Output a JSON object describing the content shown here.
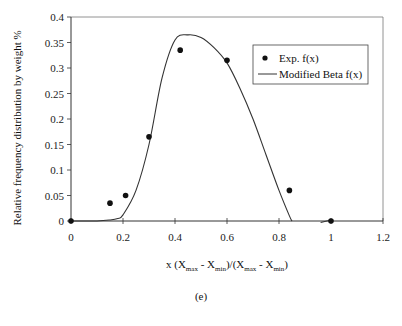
{
  "chart_data": {
    "type": "scatter",
    "title": "",
    "xlabel": "x (Xmax - Xmin)/(Xmax - Xmin)",
    "ylabel": "Relative frequency distribution by weight %",
    "xlim": [
      0,
      1.2
    ],
    "ylim": [
      0,
      0.4
    ],
    "x_ticks": [
      "0",
      "0.2",
      "0.4",
      "0.6",
      "0.8",
      "1",
      "1.2"
    ],
    "y_ticks": [
      "0",
      "0.05",
      "0.1",
      "0.15",
      "0.2",
      "0.25",
      "0.3",
      "0.35",
      "0.4"
    ],
    "grid": false,
    "legend_position": "upper right",
    "series": [
      {
        "name": "Exp. f(x)",
        "style": "markers",
        "x": [
          0,
          0.15,
          0.21,
          0.3,
          0.42,
          0.6,
          0.84,
          1.0
        ],
        "y": [
          0,
          0.035,
          0.05,
          0.165,
          0.335,
          0.315,
          0.06,
          0
        ]
      },
      {
        "name": "Modified Beta f(x)",
        "style": "line",
        "x": [
          0,
          0.1,
          0.15,
          0.18,
          0.2,
          0.25,
          0.3,
          0.35,
          0.4,
          0.45,
          0.5,
          0.55,
          0.6,
          0.65,
          0.7,
          0.75,
          0.8,
          0.84,
          0.85
        ],
        "y": [
          0,
          0.0,
          0.002,
          0.005,
          0.012,
          0.06,
          0.15,
          0.28,
          0.355,
          0.365,
          0.36,
          0.34,
          0.31,
          0.26,
          0.2,
          0.13,
          0.06,
          0.01,
          0
        ],
        "extra_segment": {
          "x": [
            0.96,
            1.0
          ],
          "y": [
            -0.003,
            0.002
          ]
        }
      }
    ]
  },
  "labels": {
    "ylabel": "Relative frequency distribution by weight %",
    "xlabel_prefix": "x (X",
    "xlabel_sub1": "max",
    "xlabel_mid1": " - X",
    "xlabel_sub2": "min",
    "xlabel_mid2": ")/(X",
    "xlabel_sub3": "max",
    "xlabel_mid3": " - X",
    "xlabel_sub4": "min",
    "xlabel_suffix": ")",
    "caption": "(e)"
  },
  "legend": {
    "items": [
      {
        "label": "Exp. f(x)"
      },
      {
        "label": "Modified Beta f(x)"
      }
    ]
  }
}
